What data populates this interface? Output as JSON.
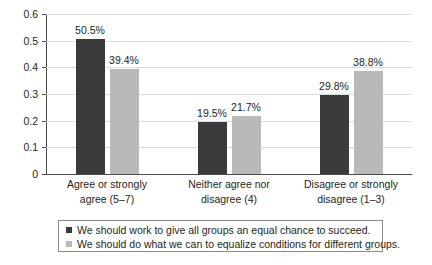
{
  "chart_data": {
    "type": "bar",
    "title": "",
    "subtitle": "",
    "xlabel": "",
    "ylabel": "",
    "ylim": [
      0,
      0.6
    ],
    "grid": true,
    "legend_position": "bottom",
    "categories": [
      "Agree or strongly agree (5–7)",
      "Neither agree nor disagree (4)",
      "Disagree or strongly disagree (1–3)"
    ],
    "category_lines": [
      [
        "Agree or strongly",
        "agree (5–7)"
      ],
      [
        "Neither agree nor",
        "disagree (4)"
      ],
      [
        "Disagree or strongly",
        "disagree (1–3)"
      ]
    ],
    "ytick_labels": [
      "0",
      "0.1",
      "0.2",
      "0.3",
      "0.4",
      "0.5",
      "0.6"
    ],
    "ytick_values": [
      0,
      0.1,
      0.2,
      0.3,
      0.4,
      0.5,
      0.6
    ],
    "series": [
      {
        "name": "We should work to give all groups an equal chance to succeed.",
        "color": "#3a3a3a",
        "values": [
          0.505,
          0.195,
          0.298
        ],
        "data_labels": [
          "50.5%",
          "19.5%",
          "29.8%"
        ]
      },
      {
        "name": "We should do what we can to equalize conditions for different groups.",
        "color": "#b9b9b9",
        "values": [
          0.394,
          0.217,
          0.388
        ],
        "data_labels": [
          "39.4%",
          "21.7%",
          "38.8%"
        ]
      }
    ]
  },
  "colors": {
    "series_dark": "#3a3a3a",
    "series_light": "#b9b9b9",
    "gridline": "#d9dde0",
    "axis": "#4b4b4b",
    "text": "#231f20",
    "background": "#ffffff",
    "legend_border": "#8c8c8c"
  }
}
